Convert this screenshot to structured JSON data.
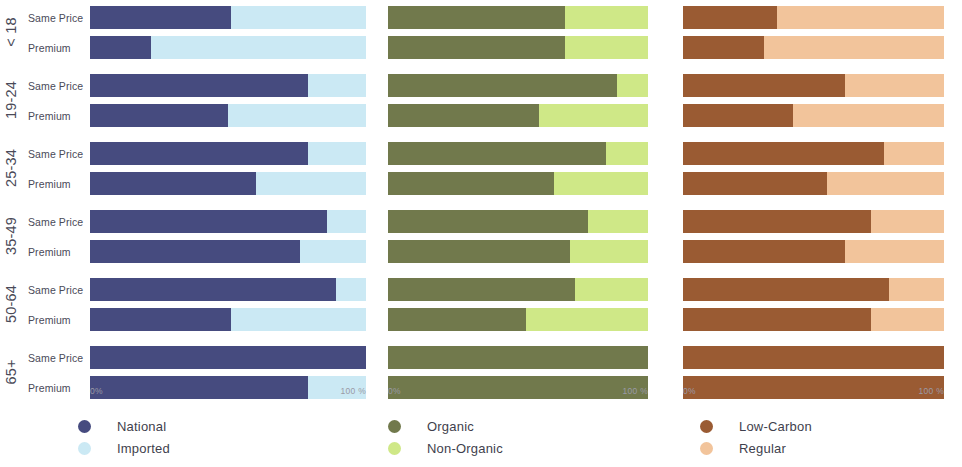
{
  "chart_data": {
    "type": "bar",
    "title": "",
    "subtitle": "",
    "orientation": "horizontal",
    "stacked": true,
    "normalized": true,
    "xlabel": "",
    "ylabel": "",
    "xlim": [
      0,
      100
    ],
    "grid": false,
    "axis_ticks": [
      "0%",
      "100 %"
    ],
    "row_groups": [
      "< 18",
      "19-24",
      "25-34",
      "35-49",
      "50-64",
      "65+"
    ],
    "row_subcategories": [
      "Same Price",
      "Premium"
    ],
    "legend_position": "bottom",
    "panels": [
      {
        "name": "origin",
        "series": [
          {
            "name": "National",
            "color": "#464b7f"
          },
          {
            "name": "Imported",
            "color": "#cbe9f4"
          }
        ],
        "rows": [
          {
            "group": "< 18",
            "sub": "Same Price",
            "values": [
              51,
              49
            ]
          },
          {
            "group": "< 18",
            "sub": "Premium",
            "values": [
              22,
              78
            ]
          },
          {
            "group": "19-24",
            "sub": "Same Price",
            "values": [
              79,
              21
            ]
          },
          {
            "group": "19-24",
            "sub": "Premium",
            "values": [
              50,
              50
            ]
          },
          {
            "group": "25-34",
            "sub": "Same Price",
            "values": [
              79,
              21
            ]
          },
          {
            "group": "25-34",
            "sub": "Premium",
            "values": [
              60,
              40
            ]
          },
          {
            "group": "35-49",
            "sub": "Same Price",
            "values": [
              86,
              14
            ]
          },
          {
            "group": "35-49",
            "sub": "Premium",
            "values": [
              76,
              24
            ]
          },
          {
            "group": "50-64",
            "sub": "Same Price",
            "values": [
              89,
              11
            ]
          },
          {
            "group": "50-64",
            "sub": "Premium",
            "values": [
              51,
              49
            ]
          },
          {
            "group": "65+",
            "sub": "Same Price",
            "values": [
              100,
              0
            ]
          },
          {
            "group": "65+",
            "sub": "Premium",
            "values": [
              79,
              21
            ]
          }
        ]
      },
      {
        "name": "farming",
        "series": [
          {
            "name": "Organic",
            "color": "#71794c"
          },
          {
            "name": "Non-Organic",
            "color": "#cfe887"
          }
        ],
        "rows": [
          {
            "group": "< 18",
            "sub": "Same Price",
            "values": [
              68,
              32
            ]
          },
          {
            "group": "< 18",
            "sub": "Premium",
            "values": [
              68,
              32
            ]
          },
          {
            "group": "19-24",
            "sub": "Same Price",
            "values": [
              88,
              12
            ]
          },
          {
            "group": "19-24",
            "sub": "Premium",
            "values": [
              58,
              42
            ]
          },
          {
            "group": "25-34",
            "sub": "Same Price",
            "values": [
              84,
              16
            ]
          },
          {
            "group": "25-34",
            "sub": "Premium",
            "values": [
              64,
              36
            ]
          },
          {
            "group": "35-49",
            "sub": "Same Price",
            "values": [
              77,
              23
            ]
          },
          {
            "group": "35-49",
            "sub": "Premium",
            "values": [
              70,
              30
            ]
          },
          {
            "group": "50-64",
            "sub": "Same Price",
            "values": [
              72,
              28
            ]
          },
          {
            "group": "50-64",
            "sub": "Premium",
            "values": [
              53,
              47
            ]
          },
          {
            "group": "65+",
            "sub": "Same Price",
            "values": [
              100,
              0
            ]
          },
          {
            "group": "65+",
            "sub": "Premium",
            "values": [
              100,
              0
            ]
          }
        ]
      },
      {
        "name": "carbon",
        "series": [
          {
            "name": "Low-Carbon",
            "color": "#9a5b33"
          },
          {
            "name": "Regular",
            "color": "#f2c49b"
          }
        ],
        "rows": [
          {
            "group": "< 18",
            "sub": "Same Price",
            "values": [
              36,
              64
            ]
          },
          {
            "group": "< 18",
            "sub": "Premium",
            "values": [
              31,
              69
            ]
          },
          {
            "group": "19-24",
            "sub": "Same Price",
            "values": [
              62,
              38
            ]
          },
          {
            "group": "19-24",
            "sub": "Premium",
            "values": [
              42,
              58
            ]
          },
          {
            "group": "25-34",
            "sub": "Same Price",
            "values": [
              77,
              23
            ]
          },
          {
            "group": "25-34",
            "sub": "Premium",
            "values": [
              55,
              45
            ]
          },
          {
            "group": "35-49",
            "sub": "Same Price",
            "values": [
              72,
              28
            ]
          },
          {
            "group": "35-49",
            "sub": "Premium",
            "values": [
              62,
              38
            ]
          },
          {
            "group": "50-64",
            "sub": "Same Price",
            "values": [
              79,
              21
            ]
          },
          {
            "group": "50-64",
            "sub": "Premium",
            "values": [
              72,
              28
            ]
          },
          {
            "group": "65+",
            "sub": "Same Price",
            "values": [
              100,
              0
            ]
          },
          {
            "group": "65+",
            "sub": "Premium",
            "values": [
              100,
              0
            ]
          }
        ]
      }
    ]
  },
  "axis": {
    "groups": [
      {
        "label": "< 18"
      },
      {
        "label": "19-24"
      },
      {
        "label": "25-34"
      },
      {
        "label": "35-49"
      },
      {
        "label": "50-64"
      },
      {
        "label": "65+"
      }
    ],
    "tick_min": "0%",
    "tick_max": "100 %",
    "bar_labels": {
      "same_price": "Same Price",
      "premium": "Premium"
    }
  },
  "legend": {
    "columns": [
      {
        "items": [
          {
            "label": "National",
            "color": "#464b7f"
          },
          {
            "label": "Imported",
            "color": "#cbe9f4"
          }
        ]
      },
      {
        "items": [
          {
            "label": "Organic",
            "color": "#71794c"
          },
          {
            "label": "Non-Organic",
            "color": "#cfe887"
          }
        ]
      },
      {
        "items": [
          {
            "label": "Low-Carbon",
            "color": "#9a5b33"
          },
          {
            "label": "Regular",
            "color": "#f2c49b"
          }
        ]
      }
    ]
  },
  "layout": {
    "panel_geometry": [
      {
        "left": 90,
        "width": 276
      },
      {
        "left": 388,
        "width": 260
      },
      {
        "left": 683,
        "width": 261
      }
    ],
    "band_tops": [
      4,
      72,
      140,
      208,
      276,
      344
    ]
  }
}
